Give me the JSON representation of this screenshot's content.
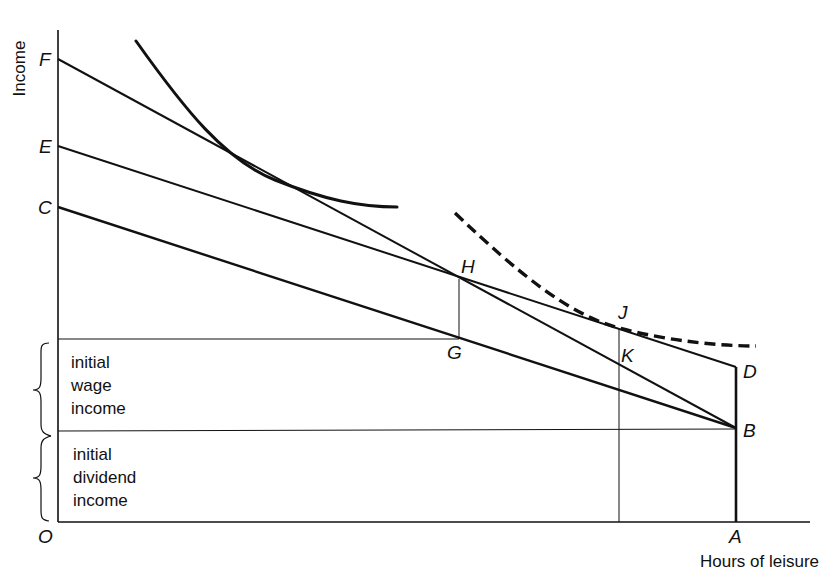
{
  "diagram": {
    "axes": {
      "y_label": "Income",
      "x_label": "Hours of leisure",
      "origin_label": "O"
    },
    "points": {
      "F": "F",
      "E": "E",
      "C": "C",
      "H": "H",
      "G": "G",
      "J": "J",
      "K": "K",
      "D": "D",
      "B": "B",
      "A": "A"
    },
    "regions": {
      "wage": [
        "initial",
        "wage",
        "income"
      ],
      "dividend": [
        "initial",
        "dividend",
        "income"
      ]
    },
    "lines": [
      {
        "name": "budget-line-FB",
        "from": "F",
        "to": "B"
      },
      {
        "name": "budget-line-ED",
        "from": "E",
        "to": "D"
      },
      {
        "name": "budget-line-CB",
        "from": "C",
        "to": "B"
      },
      {
        "name": "vertical-AD",
        "from": "A",
        "to": "D"
      }
    ],
    "curves": [
      {
        "name": "indifference-curve-solid",
        "style": "solid"
      },
      {
        "name": "indifference-curve-dashed",
        "style": "dashed"
      }
    ],
    "colors": {
      "ink": "#111111",
      "background": "#ffffff"
    }
  }
}
